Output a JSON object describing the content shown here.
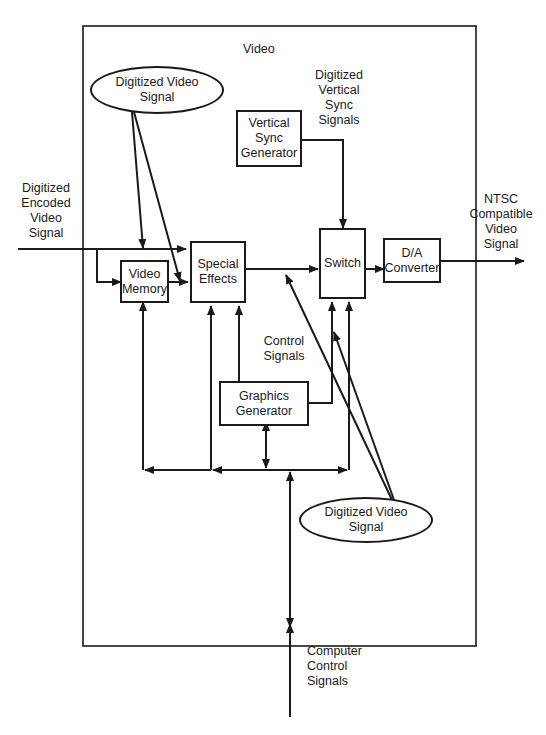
{
  "diagram": {
    "container_title": "Video",
    "blocks": {
      "video_memory": "Video\nMemory",
      "special_effects": "Special\nEffects",
      "vertical_sync_generator": "Vertical\nSync\nGenerator",
      "switch": "Switch",
      "da_converter": "D/A\nConverter",
      "graphics_generator": "Graphics\nGenerator"
    },
    "ellipses": {
      "top_digitized_video_signal": "Digitized Video\nSignal",
      "bottom_digitized_video_signal": "Digitized Video\nSignal"
    },
    "labels": {
      "input_signal": "Digitized\nEncoded\nVideo\nSignal",
      "vertical_sync_signals": "Digitized\nVertical\nSync\nSignals",
      "output_signal": "NTSC\nCompatible\nVideo\nSignal",
      "control_signals": "Control\nSignals",
      "computer_control_signals": "Computer\nControl\nSignals"
    },
    "colors": {
      "line": "#1a1a1a",
      "background": "#ffffff"
    }
  }
}
